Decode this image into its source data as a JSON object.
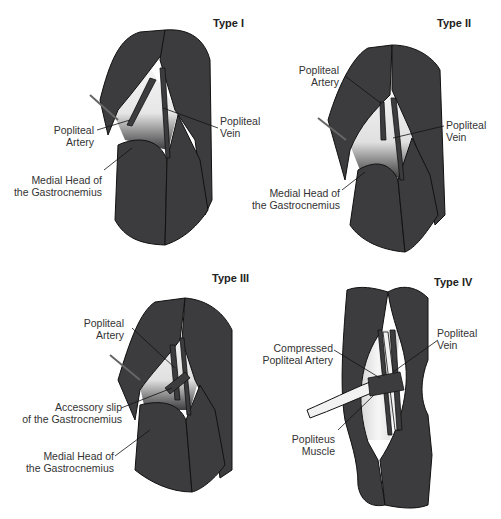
{
  "figure": {
    "colors": {
      "muscle": "#3c3c3e",
      "outline": "#111111",
      "fossa": "#f2f2f2",
      "text": "#333333"
    },
    "panels": [
      {
        "title": "Type I",
        "labels": [
          {
            "line1": "Popliteal",
            "line2": "Artery"
          },
          {
            "line1": "Popliteal",
            "line2": "Vein"
          },
          {
            "line1": "Medial Head of",
            "line2": "the Gastrocnemius"
          }
        ]
      },
      {
        "title": "Type II",
        "labels": [
          {
            "line1": "Popliteal",
            "line2": "Artery"
          },
          {
            "line1": "Popliteal",
            "line2": "Vein"
          },
          {
            "line1": "Medial Head of",
            "line2": "the Gastrocnemius"
          }
        ]
      },
      {
        "title": "Type III",
        "labels": [
          {
            "line1": "Popliteal",
            "line2": "Artery"
          },
          {
            "line1": "Accessory slip",
            "line2": "of the Gastrocnemius"
          },
          {
            "line1": "Medial Head of",
            "line2": "the Gastrocnemius"
          }
        ]
      },
      {
        "title": "Type IV",
        "labels": [
          {
            "line1": "Compressed",
            "line2": "Popliteal Artery"
          },
          {
            "line1": "Popliteal",
            "line2": "Vein"
          },
          {
            "line1": "Popliteus",
            "line2": "Muscle"
          }
        ]
      }
    ]
  }
}
